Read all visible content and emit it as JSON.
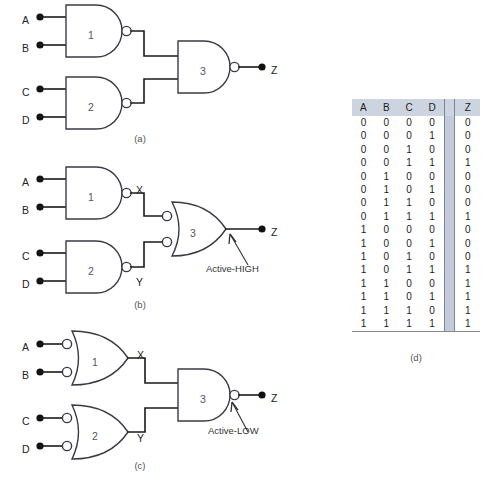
{
  "figure": {
    "panels": [
      {
        "id": "a",
        "caption": "(a)",
        "inputs": [
          "A",
          "B",
          "C",
          "D"
        ],
        "output": "Z",
        "gate_numbers": [
          "1",
          "2",
          "3"
        ],
        "gate_types": [
          "nand",
          "nand",
          "nand"
        ],
        "annotation": ""
      },
      {
        "id": "b",
        "caption": "(b)",
        "inputs": [
          "A",
          "B",
          "C",
          "D"
        ],
        "output": "Z",
        "gate_numbers": [
          "1",
          "2",
          "3"
        ],
        "gate_types": [
          "nand",
          "nand",
          "negative-or"
        ],
        "intermediate_labels": [
          "X",
          "Y"
        ],
        "annotation": "Active-HIGH"
      },
      {
        "id": "c",
        "caption": "(c)",
        "inputs": [
          "A",
          "B",
          "C",
          "D"
        ],
        "output": "Z",
        "gate_numbers": [
          "1",
          "2",
          "3"
        ],
        "gate_types": [
          "negative-or",
          "negative-or",
          "nand"
        ],
        "intermediate_labels": [
          "X",
          "Y"
        ],
        "annotation": "Active-LOW"
      }
    ]
  },
  "truth_table": {
    "caption": "(d)",
    "headers": [
      "A",
      "B",
      "C",
      "D",
      "Z"
    ],
    "rows": [
      [
        "0",
        "0",
        "0",
        "0",
        "0"
      ],
      [
        "0",
        "0",
        "0",
        "1",
        "0"
      ],
      [
        "0",
        "0",
        "1",
        "0",
        "0"
      ],
      [
        "0",
        "0",
        "1",
        "1",
        "1"
      ],
      [
        "0",
        "1",
        "0",
        "0",
        "0"
      ],
      [
        "0",
        "1",
        "0",
        "1",
        "0"
      ],
      [
        "0",
        "1",
        "1",
        "0",
        "0"
      ],
      [
        "0",
        "1",
        "1",
        "1",
        "1"
      ],
      [
        "1",
        "0",
        "0",
        "0",
        "0"
      ],
      [
        "1",
        "0",
        "0",
        "1",
        "0"
      ],
      [
        "1",
        "0",
        "1",
        "0",
        "0"
      ],
      [
        "1",
        "0",
        "1",
        "1",
        "1"
      ],
      [
        "1",
        "1",
        "0",
        "0",
        "1"
      ],
      [
        "1",
        "1",
        "0",
        "1",
        "1"
      ],
      [
        "1",
        "1",
        "1",
        "0",
        "1"
      ],
      [
        "1",
        "1",
        "1",
        "1",
        "1"
      ]
    ]
  },
  "colors": {
    "header_bg": "#ccd4e0",
    "separator_band": "#c3cbda",
    "wire": "#1a1a1a",
    "gate_stroke": "#3a3a46"
  }
}
